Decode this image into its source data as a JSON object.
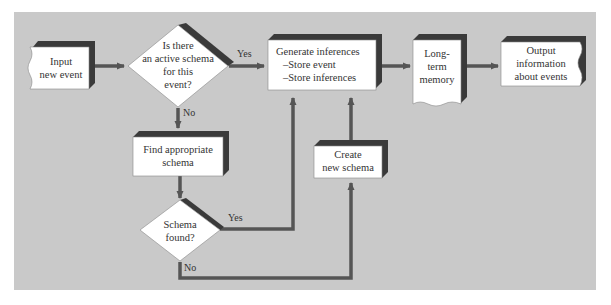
{
  "diagram": {
    "nodes": {
      "input": {
        "line1": "Input",
        "line2": "new event"
      },
      "decision_active": {
        "line1": "Is there",
        "line2": "an active schema",
        "line3": "for this",
        "line4": "event?"
      },
      "generate": {
        "line1": "Generate inferences",
        "line2": "–Store event",
        "line3": "–Store inferences"
      },
      "ltm": {
        "line1": "Long-",
        "line2": "term",
        "line3": "memory"
      },
      "output": {
        "line1": "Output",
        "line2": "information",
        "line3": "about events"
      },
      "find": {
        "line1": "Find appropriate",
        "line2": "schema"
      },
      "create": {
        "line1": "Create",
        "line2": "new schema"
      },
      "decision_found": {
        "line1": "Schema",
        "line2": "found?"
      }
    },
    "edges": {
      "active_yes": "Yes",
      "active_no": "No",
      "found_yes": "Yes",
      "found_no": "No"
    },
    "colors": {
      "background": "#c9c9c9",
      "box_fill": "#ffffff",
      "shadow": "#3a3a3a",
      "line": "#555555",
      "text": "#333333"
    }
  }
}
